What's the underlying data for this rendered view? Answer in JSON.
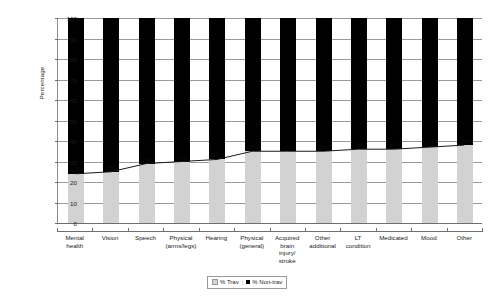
{
  "chart_data": {
    "type": "bar",
    "subtype": "stacked-bar-with-line",
    "title": "",
    "xlabel": "",
    "ylabel": "Percentage",
    "ylim": [
      0,
      100
    ],
    "ytick_step": 10,
    "yticks": [
      100,
      90,
      80,
      70,
      60,
      50,
      40,
      30,
      20,
      10,
      0
    ],
    "grid": true,
    "legend_position": "bottom",
    "categories": [
      "Mental health",
      "Vision",
      "Speech",
      "Physical (arms/legs)",
      "Hearing",
      "Physical (general)",
      "Acquired brain injury/ stroke",
      "Other additional",
      "LT condition",
      "Medicated",
      "Mood",
      "Other"
    ],
    "category_lines": [
      [
        "Mental",
        "health"
      ],
      [
        "Vision"
      ],
      [
        "Speech"
      ],
      [
        "Physical",
        "(arms/legs)"
      ],
      [
        "Hearing"
      ],
      [
        "Physical",
        "(general)"
      ],
      [
        "Acquired",
        "brain",
        "injury/",
        "stroke"
      ],
      [
        "Other",
        "additional"
      ],
      [
        "LT",
        "condition"
      ],
      [
        "Medicated"
      ],
      [
        "Mood"
      ],
      [
        "Other"
      ]
    ],
    "series": [
      {
        "name": "% Trav",
        "color": "#d2d2d2",
        "values": [
          24,
          25,
          29,
          30,
          31,
          35,
          35,
          35,
          36,
          36,
          37,
          38
        ],
        "labels": [
          "24%",
          "25%",
          "29%",
          "30%",
          "31%",
          "35%",
          "35%",
          "35%",
          "36%",
          "36%",
          "37%",
          "38%"
        ]
      },
      {
        "name": "% Non-trav",
        "color": "#000000",
        "values": [
          76,
          75,
          71,
          70,
          69,
          65,
          65,
          65,
          64,
          64,
          63,
          62
        ],
        "labels": []
      }
    ],
    "overlay_line": {
      "name": "% Trav trend",
      "color": "#1a1a1a",
      "values": [
        24,
        25,
        29,
        30,
        31,
        35,
        35,
        35,
        36,
        36,
        37,
        38
      ]
    }
  },
  "legend": {
    "items": [
      {
        "label": "% Trav",
        "swatch": "trav-swatch"
      },
      {
        "label": "% Non-trav",
        "swatch": "nontrav-swatch"
      }
    ],
    "separator": ";"
  }
}
